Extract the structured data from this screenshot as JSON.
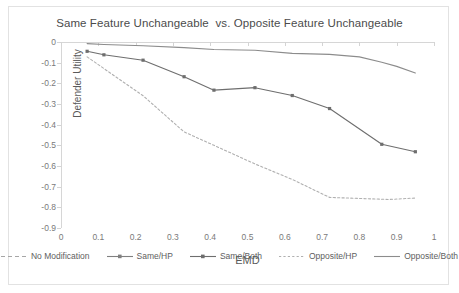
{
  "chart_data": {
    "type": "line",
    "title": "Same Feature Unchangeable  vs. Opposite Feature Unchangeable",
    "xlabel": "EMD",
    "ylabel": "Defender Utility",
    "xlim": [
      0,
      1
    ],
    "ylim": [
      -0.9,
      0
    ],
    "xticks": [
      "0",
      "0.1",
      "0.2",
      "0.3",
      "0.4",
      "0.5",
      "0.6",
      "0.7",
      "0.8",
      "0.9",
      "1"
    ],
    "xtick_values": [
      0,
      0.1,
      0.2,
      0.3,
      0.4,
      0.5,
      0.6,
      0.7,
      0.8,
      0.9,
      1
    ],
    "yticks": [
      "0",
      "-0.1",
      "-0.2",
      "-0.3",
      "-0.4",
      "-0.5",
      "-0.6",
      "-0.7",
      "-0.8",
      "-0.9"
    ],
    "ytick_values": [
      0,
      -0.1,
      -0.2,
      -0.3,
      -0.4,
      -0.5,
      -0.6,
      -0.7,
      -0.8,
      -0.9
    ],
    "grid": false,
    "legend_position": "bottom",
    "series": [
      {
        "name": "No Modification",
        "style": "dashed",
        "marker": "none",
        "color": "#a6a6a6",
        "visible_in_plot": false,
        "x": [],
        "y": []
      },
      {
        "name": "Same/HP",
        "style": "solid",
        "marker": "square",
        "color": "#808080",
        "visible_in_plot": false,
        "x": [],
        "y": []
      },
      {
        "name": "Same/Both",
        "style": "solid",
        "marker": "square",
        "color": "#6e6e6e",
        "visible_in_plot": true,
        "x": [
          0.07,
          0.115,
          0.22,
          0.33,
          0.41,
          0.52,
          0.62,
          0.72,
          0.86,
          0.95
        ],
        "y": [
          -0.045,
          -0.062,
          -0.088,
          -0.168,
          -0.233,
          -0.221,
          -0.259,
          -0.322,
          -0.495,
          -0.531
        ]
      },
      {
        "name": "Opposite/HP",
        "style": "dotted",
        "marker": "none",
        "color": "#b0b0b0",
        "visible_in_plot": true,
        "x": [
          0.07,
          0.22,
          0.33,
          0.41,
          0.52,
          0.62,
          0.72,
          0.8,
          0.88,
          0.95
        ],
        "y": [
          -0.072,
          -0.26,
          -0.435,
          -0.5,
          -0.59,
          -0.665,
          -0.752,
          -0.757,
          -0.762,
          -0.755
        ]
      },
      {
        "name": "Opposite/Both",
        "style": "solid",
        "marker": "none",
        "color": "#8c8c8c",
        "visible_in_plot": true,
        "x": [
          0.07,
          0.115,
          0.22,
          0.33,
          0.41,
          0.52,
          0.62,
          0.72,
          0.8,
          0.86,
          0.9,
          0.95
        ],
        "y": [
          -0.008,
          -0.012,
          -0.018,
          -0.027,
          -0.036,
          -0.04,
          -0.055,
          -0.06,
          -0.072,
          -0.098,
          -0.118,
          -0.15
        ]
      }
    ]
  }
}
